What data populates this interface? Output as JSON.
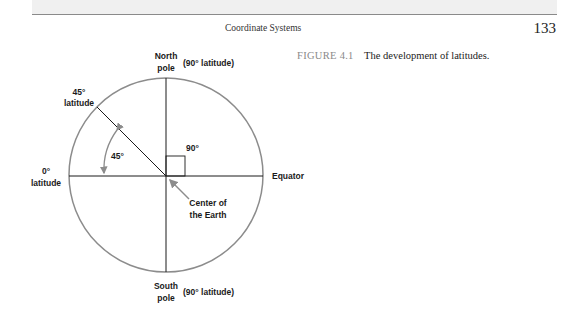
{
  "page": {
    "running_head": "Coordinate Systems",
    "page_number": "133"
  },
  "figure": {
    "label": "FIGURE 4.1",
    "caption": "The development of latitudes."
  },
  "diagram": {
    "north_pole": {
      "line1": "North",
      "line2": "pole",
      "note": "(90° latitude)"
    },
    "south_pole": {
      "line1": "South",
      "line2": "pole",
      "note": "(90° latitude)"
    },
    "lat45": {
      "line1": "45°",
      "line2": "latitude"
    },
    "lat0": {
      "line1": "0°",
      "line2": "latitude"
    },
    "equator": "Equator",
    "angle_45": "45°",
    "angle_90": "90°",
    "center": {
      "line1": "Center of",
      "line2": "the Earth"
    },
    "colors": {
      "circle": "#8c8c8c",
      "lines": "#1a1a1a",
      "arrow": "#8c8c8c"
    }
  }
}
